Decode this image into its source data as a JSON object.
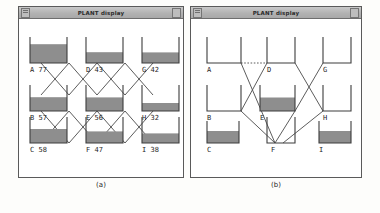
{
  "figure": {
    "panels": [
      {
        "id": "panel-a",
        "caption": "(a)",
        "window_title": "PLANT display",
        "tanks": [
          {
            "id": "A",
            "label": "A",
            "value": "77",
            "level": 77,
            "row": 0,
            "col": 0,
            "filled": true,
            "text": "A  77"
          },
          {
            "id": "D",
            "label": "D",
            "value": "43",
            "level": 43,
            "row": 0,
            "col": 1,
            "filled": true,
            "text": "D  43"
          },
          {
            "id": "G",
            "label": "G",
            "value": "42",
            "level": 42,
            "row": 0,
            "col": 2,
            "filled": true,
            "text": "G  42"
          },
          {
            "id": "B",
            "label": "B",
            "value": "57",
            "level": 57,
            "row": 1,
            "col": 0,
            "filled": true,
            "text": "B  57"
          },
          {
            "id": "E",
            "label": "E",
            "value": "56",
            "level": 56,
            "row": 1,
            "col": 1,
            "filled": true,
            "text": "E  56"
          },
          {
            "id": "H",
            "label": "H",
            "value": "32",
            "level": 32,
            "row": 1,
            "col": 2,
            "filled": true,
            "text": "H  32"
          },
          {
            "id": "C",
            "label": "C",
            "value": "58",
            "level": 58,
            "row": 2,
            "col": 0,
            "filled": true,
            "text": "C  58"
          },
          {
            "id": "F",
            "label": "F",
            "value": "47",
            "level": 47,
            "row": 2,
            "col": 1,
            "filled": true,
            "text": "F  47"
          },
          {
            "id": "I",
            "label": "I",
            "value": "38",
            "level": 38,
            "row": 2,
            "col": 2,
            "filled": true,
            "text": "I  38"
          }
        ],
        "connections": [
          {
            "from": "A",
            "to": "E",
            "style": "solid"
          },
          {
            "from": "B",
            "to": "D",
            "style": "solid"
          },
          {
            "from": "D",
            "to": "H",
            "style": "solid"
          },
          {
            "from": "E",
            "to": "G",
            "style": "solid"
          },
          {
            "from": "B",
            "to": "F",
            "style": "solid"
          },
          {
            "from": "C",
            "to": "E",
            "style": "solid"
          },
          {
            "from": "E",
            "to": "I",
            "style": "solid"
          },
          {
            "from": "F",
            "to": "H",
            "style": "solid"
          },
          {
            "from": "A",
            "to": "D",
            "style": "solid"
          },
          {
            "from": "D",
            "to": "G",
            "style": "solid"
          },
          {
            "from": "B",
            "to": "E",
            "style": "solid"
          },
          {
            "from": "E",
            "to": "H",
            "style": "solid"
          },
          {
            "from": "C",
            "to": "F",
            "style": "solid"
          },
          {
            "from": "F",
            "to": "I",
            "style": "solid"
          }
        ]
      },
      {
        "id": "panel-b",
        "caption": "(b)",
        "window_title": "PLANT display",
        "tanks": [
          {
            "id": "A",
            "label": "A",
            "value": "",
            "level": 0,
            "row": 0,
            "col": 0,
            "filled": false,
            "text": "A"
          },
          {
            "id": "D",
            "label": "D",
            "value": "",
            "level": 0,
            "row": 0,
            "col": 1,
            "filled": false,
            "text": "D"
          },
          {
            "id": "G",
            "label": "G",
            "value": "",
            "level": 0,
            "row": 0,
            "col": 2,
            "filled": false,
            "text": "G"
          },
          {
            "id": "B",
            "label": "B",
            "value": "",
            "level": 0,
            "row": 1,
            "col": 0,
            "filled": false,
            "text": "B"
          },
          {
            "id": "E",
            "label": "E",
            "value": "",
            "level": 52,
            "row": 1,
            "col": 1,
            "filled": true,
            "text": "E"
          },
          {
            "id": "H",
            "label": "H",
            "value": "",
            "level": 0,
            "row": 1,
            "col": 2,
            "filled": false,
            "text": "H"
          },
          {
            "id": "C",
            "label": "C",
            "value": "",
            "level": 55,
            "row": 2,
            "col": 0,
            "filled": true,
            "text": "C"
          },
          {
            "id": "F",
            "label": "F",
            "value": "",
            "level": 0,
            "row": 2,
            "col": 1,
            "filled": false,
            "text": "F"
          },
          {
            "id": "I",
            "label": "I",
            "value": "",
            "level": 55,
            "row": 2,
            "col": 2,
            "filled": true,
            "text": "I"
          }
        ],
        "connections": [
          {
            "from": "A",
            "to": "D",
            "style": "dotted"
          },
          {
            "from": "A",
            "to": "F",
            "style": "solid"
          },
          {
            "from": "D",
            "to": "B",
            "style": "solid"
          },
          {
            "from": "B",
            "to": "F",
            "style": "solid"
          },
          {
            "from": "D",
            "to": "H",
            "style": "solid"
          },
          {
            "from": "G",
            "to": "E",
            "style": "solid"
          },
          {
            "from": "E",
            "to": "F",
            "style": "solid"
          },
          {
            "from": "H",
            "to": "F",
            "style": "solid"
          }
        ]
      }
    ],
    "colors": {
      "fill": "#8e8e8e",
      "outline": "#3d3d3d",
      "titlebar": "#b8b8b8",
      "background": "#ffffff",
      "text": "#1e1e1e"
    }
  }
}
